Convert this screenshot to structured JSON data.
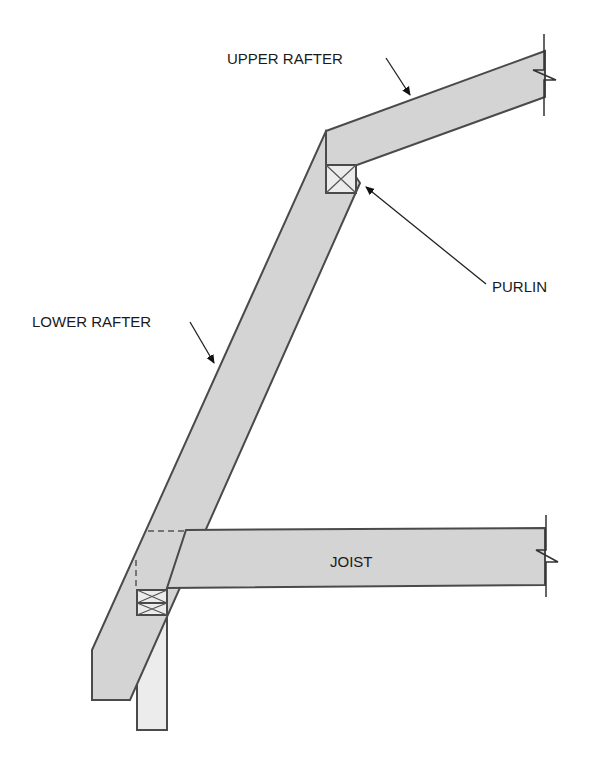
{
  "diagram": {
    "labels": {
      "upper_rafter": "UPPER RAFTER",
      "purlin": "PURLIN",
      "lower_rafter": "LOWER RAFTER",
      "joist": "JOIST"
    },
    "colors": {
      "member_fill": "#d4d4d4",
      "post_fill": "#ececec",
      "outline": "#4a4a4a",
      "text": "#1a1a1a",
      "background": "#ffffff"
    },
    "components": [
      "upper rafter",
      "purlin",
      "lower rafter",
      "joist",
      "wall top plates",
      "wall stud"
    ]
  }
}
